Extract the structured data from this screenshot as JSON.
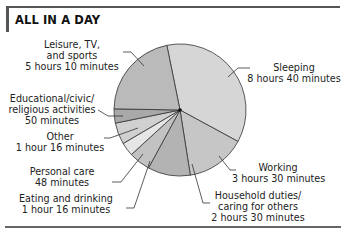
{
  "title": "ALL IN A DAY",
  "chart_data": {
    "type": "pie",
    "title": "ALL IN A DAY",
    "unit": "minutes",
    "total": 1440,
    "start_angle_deg": -11.5,
    "direction": "clockwise",
    "slices": [
      {
        "label": "Sleeping",
        "value_text": "8 hours 40 minutes",
        "minutes": 520,
        "color": "#d6d6d6"
      },
      {
        "label": "Working",
        "value_text": "3 hours 30 minutes",
        "minutes": 210,
        "color": "#c6c6c6"
      },
      {
        "label": "Household duties/ caring for others",
        "value_text": "2 hours 30 minutes",
        "minutes": 150,
        "color": "#b3b3b3"
      },
      {
        "label": "Eating and drinking",
        "value_text": "1 hour 16 minutes",
        "minutes": 76,
        "color": "#c2c2c2"
      },
      {
        "label": "Personal care",
        "value_text": "48 minutes",
        "minutes": 48,
        "color": "#e6e6e6"
      },
      {
        "label": "Other",
        "value_text": "1 hour 16 minutes",
        "minutes": 76,
        "color": "#d0d0d0"
      },
      {
        "label": "Educational/civic/ religious activities",
        "value_text": "50 minutes",
        "minutes": 50,
        "color": "#a9a9a9"
      },
      {
        "label": "Leisure, TV, and sports",
        "value_text": "5 hours 10 minutes",
        "minutes": 310,
        "color": "#bababa"
      }
    ]
  },
  "labels": {
    "sleeping": {
      "line1": "Sleeping",
      "line2": "8 hours 40 minutes"
    },
    "working": {
      "line1": "Working",
      "line2": "3 hours 30 minutes"
    },
    "household": {
      "line1": "Household duties/",
      "line2": "caring for others",
      "line3": "2 hours 30 minutes"
    },
    "eating": {
      "line1": "Eating and drinking",
      "line2": "1 hour 16 minutes"
    },
    "personal": {
      "line1": "Personal care",
      "line2": "48 minutes"
    },
    "other": {
      "line1": "Other",
      "line2": "1 hour 16 minutes"
    },
    "educational": {
      "line1": "Educational/civic/",
      "line2": "religious activities",
      "line3": "50 minutes"
    },
    "leisure": {
      "line1": "Leisure, TV,",
      "line2": "and sports",
      "line3": "5 hours 10 minutes"
    }
  }
}
